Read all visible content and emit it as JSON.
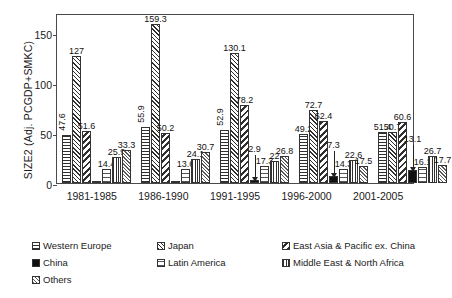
{
  "chart_data": {
    "type": "bar",
    "title": "",
    "xlabel": "",
    "ylabel": "SIZE2 (Adj. PCGDP+SMKC)",
    "ylim": [
      0,
      170
    ],
    "yticks": [
      0,
      50,
      100,
      150
    ],
    "grid": false,
    "legend_position": "bottom",
    "categories": [
      "1981-1985",
      "1986-1990",
      "1991-1995",
      "1996-2000",
      "2001-2005"
    ],
    "series": [
      {
        "name": "Western Europe",
        "pattern": "horizontal-lines",
        "values": [
          47.6,
          55.9,
          52.9,
          49.2,
          51.4
        ]
      },
      {
        "name": "Japan",
        "pattern": "diagonal-crosshatch",
        "values": [
          127,
          159.3,
          130.1,
          72.7,
          50.7
        ]
      },
      {
        "name": "East Asia & Pacific ex. China",
        "pattern": "thick-diagonal",
        "values": [
          51.6,
          50.2,
          78.2,
          62.4,
          60.6
        ]
      },
      {
        "name": "China",
        "pattern": "solid-black",
        "values": [
          0.8,
          1.2,
          2.9,
          7.3,
          13.1
        ]
      },
      {
        "name": "Latin America",
        "pattern": "light-horizontal-lines",
        "values": [
          14.4,
          13.6,
          17.3,
          14.3,
          16.1
        ]
      },
      {
        "name": "Middle East & North Africa",
        "pattern": "vertical-lines",
        "values": [
          25.9,
          24.1,
          22,
          22.6,
          26.7
        ]
      },
      {
        "name": "Others",
        "pattern": "fine-crosshatch",
        "values": [
          33.3,
          30.7,
          26.8,
          17.5,
          17.7
        ]
      }
    ],
    "value_labels": [
      [
        "47.6",
        "127",
        "51.6",
        "",
        "14.4",
        "25.9",
        "33.3"
      ],
      [
        "55.9",
        "159.3",
        "50.2",
        "",
        "13.6",
        "24.1",
        "30.7"
      ],
      [
        "52.9",
        "130.1",
        "78.2",
        "2.9",
        "17.3",
        "22",
        "26.8"
      ],
      [
        "49.2",
        "72.7",
        "62.4",
        "7.3",
        "14.3",
        "22.6",
        "17.5"
      ],
      [
        "51.4",
        "50.7",
        "60.6",
        "13.1",
        "16.1",
        "26.7",
        "17.7"
      ]
    ]
  },
  "legend": {
    "items": [
      {
        "label": "Western Europe"
      },
      {
        "label": "Japan"
      },
      {
        "label": "East Asia & Pacific ex. China"
      },
      {
        "label": "China"
      },
      {
        "label": "Latin America"
      },
      {
        "label": "Middle East & North Africa"
      },
      {
        "label": "Others"
      }
    ]
  }
}
